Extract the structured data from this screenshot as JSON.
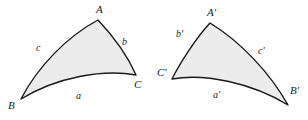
{
  "figure": {
    "fill_color": "#ececec",
    "stroke_color": "#1a1a1a",
    "background_color": "#ffffff",
    "triangles": [
      {
        "id": "left-triangle",
        "name": "triangle-ABC",
        "vertices": [
          {
            "label": "A",
            "x": 98,
            "y": 20,
            "label_x": 96,
            "label_y": 4
          },
          {
            "label": "B",
            "x": 21,
            "y": 99,
            "label_x": 8,
            "label_y": 100
          },
          {
            "label": "C",
            "x": 136,
            "y": 75,
            "label_x": 134,
            "label_y": 79
          }
        ],
        "sides": [
          {
            "label": "a",
            "from": "B",
            "to": "C",
            "label_x": 76,
            "label_y": 91
          },
          {
            "label": "b",
            "from": "A",
            "to": "C",
            "label_x": 122,
            "label_y": 37
          },
          {
            "label": "c",
            "from": "A",
            "to": "B",
            "label_x": 36,
            "label_y": 43
          }
        ]
      },
      {
        "id": "right-triangle",
        "name": "triangle-A-prime-B-prime-C-prime",
        "vertices": [
          {
            "label": "A'",
            "x": 210,
            "y": 23,
            "label_x": 207,
            "label_y": 7
          },
          {
            "label": "B'",
            "x": 288,
            "y": 105,
            "label_x": 290,
            "label_y": 85
          },
          {
            "label": "C'",
            "x": 172,
            "y": 79,
            "label_x": 157,
            "label_y": 67
          }
        ],
        "sides": [
          {
            "label": "a'",
            "from": "C'",
            "to": "B'",
            "label_x": 213,
            "label_y": 90
          },
          {
            "label": "b'",
            "from": "A'",
            "to": "C'",
            "label_x": 176,
            "label_y": 29
          },
          {
            "label": "c'",
            "from": "A'",
            "to": "B'",
            "label_x": 258,
            "label_y": 46
          }
        ]
      }
    ],
    "paths": {
      "left": "M 21 99 C 38 66, 68 36, 98 20 C 115 38, 129 59, 136 75 C 103 69, 57 77, 21 99 Z",
      "right": "M 288 105 C 270 73, 241 42, 210 23 C 196 38, 180 63, 172 79 C 205 73, 252 83, 288 105 Z"
    }
  }
}
